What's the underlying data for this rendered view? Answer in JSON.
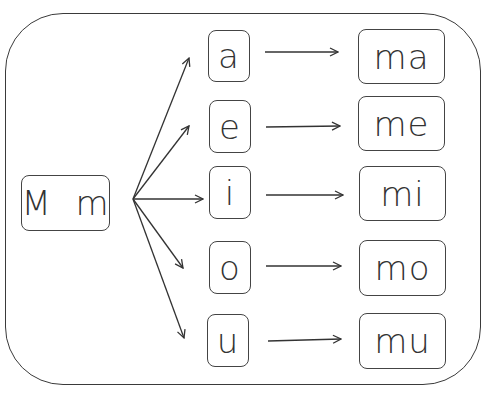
{
  "diagram": {
    "source": {
      "label": "M  m"
    },
    "vowels": [
      {
        "label": "a",
        "result": "ma"
      },
      {
        "label": "e",
        "result": "me"
      },
      {
        "label": "i",
        "result": "mi"
      },
      {
        "label": "o",
        "result": "mo"
      },
      {
        "label": "u",
        "result": "mu"
      }
    ],
    "stroke_color": "#333333"
  }
}
